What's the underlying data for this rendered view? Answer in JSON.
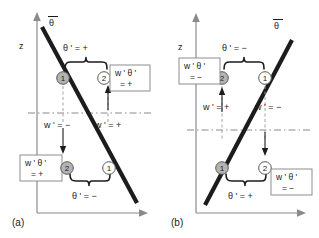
{
  "figure": {
    "vertical_axis_label": "z",
    "mean_profile_label": "θ"
  },
  "panels": [
    {
      "id": "a",
      "caption": "(a)",
      "profile_slope": "negative",
      "axis": {
        "z_label": "z",
        "theta_bar_label": "θ"
      },
      "upper": {
        "theta_label": "θ ' = +",
        "w_left_label": "w ' = −",
        "w_right_label": "w ' = +",
        "parcel_on_line": {
          "number": "1",
          "style": "gray"
        },
        "parcel_displaced": {
          "number": "2",
          "style": "white"
        },
        "flux_box": {
          "line1": "w ' θ '",
          "line2": "= +"
        }
      },
      "lower": {
        "theta_label": "θ ' = −",
        "parcel_on_line": {
          "number": "1",
          "style": "white"
        },
        "parcel_displaced": {
          "number": "2",
          "style": "gray"
        },
        "flux_box": {
          "line1": "w ' θ '",
          "line2": "= +"
        }
      }
    },
    {
      "id": "b",
      "caption": "(b)",
      "profile_slope": "positive",
      "axis": {
        "z_label": "z",
        "theta_bar_label": "θ"
      },
      "upper": {
        "theta_label": "θ ' = −",
        "w_left_label": "w ' = +",
        "w_right_label": "w ' = −",
        "parcel_on_line": {
          "number": "1",
          "style": "white"
        },
        "parcel_displaced": {
          "number": "2",
          "style": "gray"
        },
        "flux_box": {
          "line1": "w ' θ '",
          "line2": "= −"
        }
      },
      "lower": {
        "theta_label": "θ ' = +",
        "parcel_on_line": {
          "number": "1",
          "style": "gray"
        },
        "parcel_displaced": {
          "number": "2",
          "style": "white"
        },
        "flux_box": {
          "line1": "w ' θ '",
          "line2": "= −"
        }
      }
    }
  ],
  "colors": {
    "line": "#1c1c1c",
    "axis": "#8a8a8a",
    "parcel_gray": "#b3b3b3",
    "parcel_white": "#ffffff",
    "box_border": "#8d8d8d",
    "background": "#ffffff"
  }
}
